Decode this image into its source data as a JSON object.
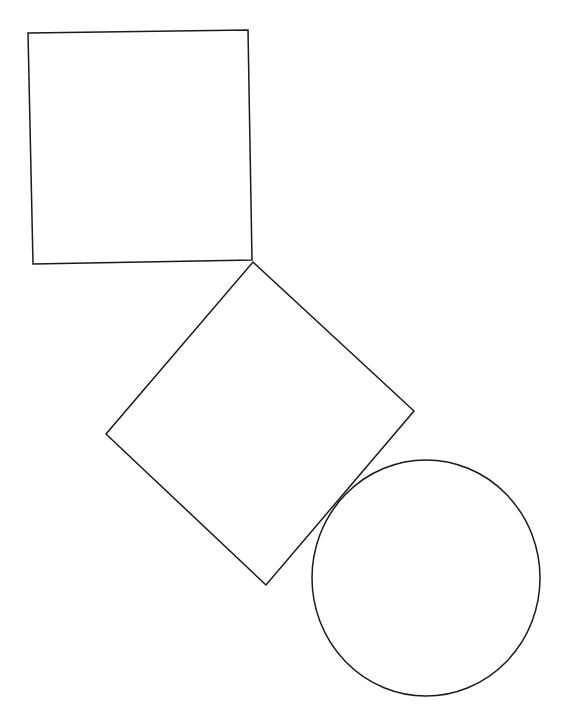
{
  "canvas": {
    "width": 571,
    "height": 716,
    "background": "#ffffff"
  },
  "stroke": {
    "color": "#1a1a1a",
    "width": 1.5
  },
  "shapes": [
    {
      "id": "square",
      "type": "polygon",
      "label": "square",
      "points": [
        [
          28,
          33
        ],
        [
          248,
          30
        ],
        [
          252,
          260
        ],
        [
          33,
          264
        ]
      ]
    },
    {
      "id": "diamond",
      "type": "polygon",
      "label": "rotated-square",
      "points": [
        [
          253,
          262
        ],
        [
          414,
          411
        ],
        [
          266,
          585
        ],
        [
          106,
          434
        ]
      ]
    },
    {
      "id": "circle",
      "type": "ellipse",
      "label": "circle",
      "cx": 426,
      "cy": 578,
      "rx": 114,
      "ry": 118
    }
  ]
}
